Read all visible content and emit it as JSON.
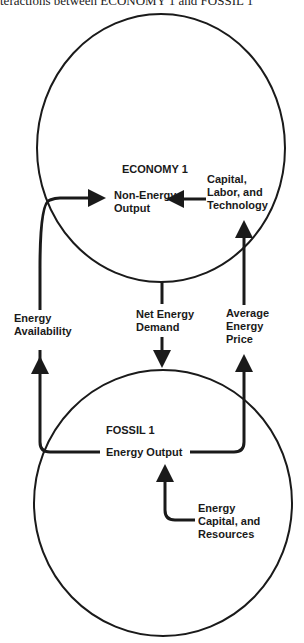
{
  "caption": "teractions between ECONOMY 1 and FOSSIL 1",
  "economy": {
    "title": "ECONOMY 1",
    "non_energy_output": [
      "Non-Energy",
      "Output"
    ],
    "capital_labor_tech": [
      "Capital,",
      "Labor, and",
      "Technology"
    ]
  },
  "links": {
    "energy_availability": [
      "Energy",
      "Availability"
    ],
    "net_energy_demand": [
      "Net Energy",
      "Demand"
    ],
    "average_energy_price": [
      "Average",
      "Energy",
      "Price"
    ]
  },
  "fossil": {
    "title": "FOSSIL 1",
    "energy_output": "Energy Output",
    "energy_capital_resources": [
      "Energy",
      "Capital, and",
      "Resources"
    ]
  },
  "colors": {
    "stroke": "#1a1a1a",
    "background": "#ffffff"
  }
}
